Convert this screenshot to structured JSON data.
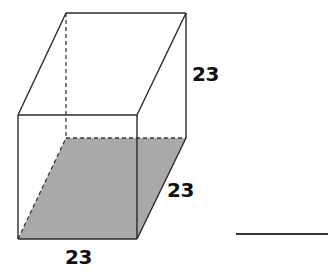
{
  "figure": {
    "type": "rectangular prism",
    "base_fill_color": "#a9a9a9",
    "edge_color": "#2a2a2a",
    "vertices": {
      "front_top_left": [
        18,
        115
      ],
      "front_top_right": [
        137,
        115
      ],
      "front_bottom_left": [
        18,
        239
      ],
      "front_bottom_right": [
        137,
        239
      ],
      "back_top_left": [
        66,
        13
      ],
      "back_top_right": [
        186,
        13
      ],
      "back_bottom_left": [
        66,
        138
      ],
      "back_bottom_right": [
        186,
        138
      ]
    }
  },
  "labels": {
    "height": "23",
    "depth": "23",
    "width": "23"
  },
  "answer": {
    "blank": ""
  }
}
